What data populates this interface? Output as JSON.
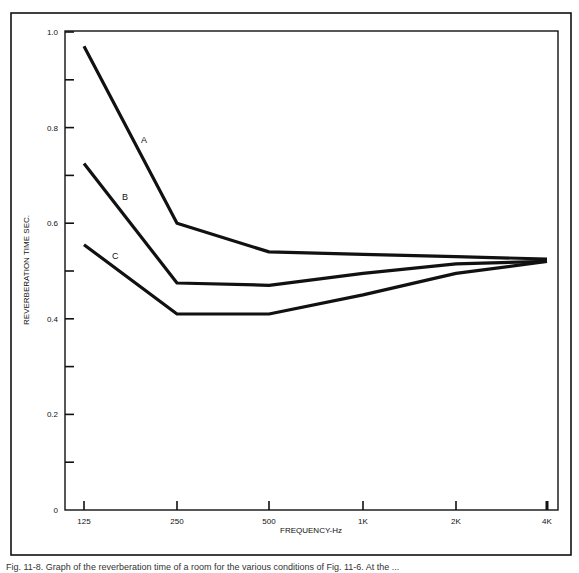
{
  "chart_data": {
    "type": "line",
    "title": "",
    "xlabel": "FREQUENCY-Hz",
    "ylabel": "REVERBERATION TIME SEC.",
    "categories": [
      "125",
      "250",
      "500",
      "1K",
      "2K",
      "4K"
    ],
    "x_scale": "log2 (octave bands)",
    "ylim": [
      0,
      1.0
    ],
    "y_ticks_labeled": [
      "0",
      "0.2",
      "0.4",
      "0.6",
      "0.8",
      "1.0"
    ],
    "y_ticks_minor": [
      0.1,
      0.3,
      0.5,
      0.7,
      0.9
    ],
    "grid": false,
    "legend": "inline labels on curves",
    "series": [
      {
        "name": "A",
        "values": [
          0.97,
          0.6,
          0.54,
          0.535,
          0.53,
          0.525
        ]
      },
      {
        "name": "B",
        "values": [
          0.725,
          0.475,
          0.47,
          0.495,
          0.515,
          0.52
        ]
      },
      {
        "name": "C",
        "values": [
          0.555,
          0.41,
          0.41,
          0.45,
          0.495,
          0.52
        ]
      }
    ]
  },
  "axes": {
    "x_label": "FREQUENCY-Hz",
    "y_label": "REVERBERATION TIME SEC.",
    "x_ticks": [
      "125",
      "250",
      "500",
      "1K",
      "2K",
      "4K"
    ],
    "y_ticks": [
      "0",
      "0.2",
      "0.4",
      "0.6",
      "0.8",
      "1.0"
    ]
  },
  "series_labels": [
    "A",
    "B",
    "C"
  ],
  "caption": "Fig. 11-8. Graph of the reverberation time of a room for the various conditions of Fig. 11-6. At the ...",
  "colors": {
    "line": "#111111",
    "background": "#ffffff"
  }
}
